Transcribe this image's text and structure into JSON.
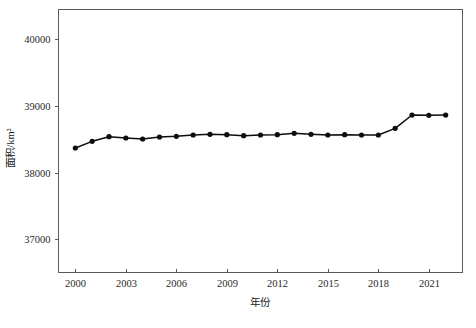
{
  "chart_data": {
    "type": "line",
    "title": "",
    "xlabel": "年份",
    "ylabel": "面积/km²",
    "x": [
      2000,
      2001,
      2002,
      2003,
      2004,
      2005,
      2006,
      2007,
      2008,
      2009,
      2010,
      2011,
      2012,
      2013,
      2014,
      2015,
      2016,
      2017,
      2018,
      2019,
      2020,
      2021,
      2022
    ],
    "values": [
      38370,
      38470,
      38540,
      38520,
      38505,
      38535,
      38545,
      38565,
      38575,
      38570,
      38555,
      38565,
      38570,
      38590,
      38575,
      38565,
      38570,
      38565,
      38565,
      38665,
      38865,
      38860,
      38865
    ],
    "series": [
      {
        "name": "面积",
        "values": [
          38370,
          38470,
          38540,
          38520,
          38505,
          38535,
          38545,
          38565,
          38575,
          38570,
          38555,
          38565,
          38570,
          38590,
          38575,
          38565,
          38570,
          38565,
          38565,
          38665,
          38865,
          38860,
          38865
        ]
      }
    ],
    "xlim": [
      1999,
      2023
    ],
    "ylim": [
      36500,
      40450
    ],
    "xticks": [
      2000,
      2003,
      2006,
      2009,
      2012,
      2015,
      2018,
      2021
    ],
    "xtick_labels": [
      "2000",
      "2003",
      "2006",
      "2009",
      "2012",
      "2015",
      "2018",
      "2021"
    ],
    "yticks": [
      37000,
      38000,
      39000,
      40000
    ],
    "ytick_labels": [
      "37000",
      "38000",
      "39000",
      "40000"
    ],
    "grid": false,
    "legend": null,
    "legend_position": "none",
    "marker": "circle",
    "line_color": "#0d0d0d",
    "marker_color": "#0d0d0d",
    "axis_color": "#5a5a5a",
    "background_color": "#ffffff"
  }
}
